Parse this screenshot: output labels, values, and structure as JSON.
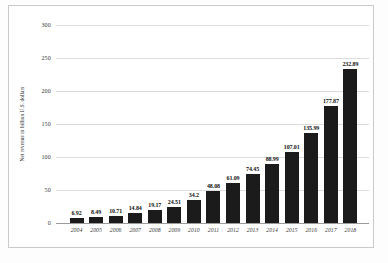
{
  "chart_data": {
    "type": "bar",
    "title": "",
    "subtitle": "",
    "xlabel": "",
    "ylabel": "Net revenue in billion U.S. dollars",
    "ylim": [
      0,
      300
    ],
    "yticks": [
      0,
      50,
      100,
      150,
      200,
      250,
      300
    ],
    "ytick_labels": [
      "0",
      "50",
      "100",
      "150",
      "200",
      "250",
      "300"
    ],
    "grid": true,
    "legend": false,
    "legend_position": "none",
    "bar_color": "#1b1b1b",
    "categories": [
      "2004",
      "2005",
      "2006",
      "2007",
      "2008",
      "2009",
      "2010",
      "2011",
      "2012",
      "2013",
      "2014",
      "2015",
      "2016",
      "2017",
      "2018"
    ],
    "values": [
      6.92,
      8.49,
      10.71,
      14.84,
      19.17,
      24.51,
      34.2,
      48.08,
      61.09,
      74.45,
      88.99,
      107.01,
      135.99,
      177.87,
      232.89
    ],
    "value_labels": [
      "6.92",
      "8.49",
      "10.71",
      "14.84",
      "19.17",
      "24.51",
      "34.2",
      "48.08",
      "61.09",
      "74.45",
      "88.99",
      "107.01",
      "135.99",
      "177.87",
      "232.89"
    ],
    "series": [
      {
        "name": "Net revenue",
        "values": [
          6.92,
          8.49,
          10.71,
          14.84,
          19.17,
          24.51,
          34.2,
          48.08,
          61.09,
          74.45,
          88.99,
          107.01,
          135.99,
          177.87,
          232.89
        ]
      }
    ]
  },
  "colors": {
    "bar": "#1b1b1b",
    "gridline": "#dcdcdc",
    "baseline": "#9a9a9a",
    "frame_border": "#c9c9c9",
    "background": "#ffffff",
    "tick_text": "#3a3a3a",
    "label_text": "#111111"
  }
}
